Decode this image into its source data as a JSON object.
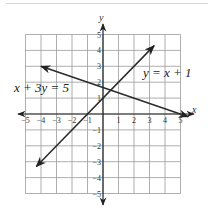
{
  "chart_data": {
    "type": "line",
    "title": "",
    "xlabel": "x",
    "ylabel": "y",
    "xlim": [
      -5,
      5
    ],
    "ylim": [
      -5,
      5
    ],
    "grid": true,
    "x_ticks": [
      "-5",
      "-4",
      "-3",
      "-2",
      "-1",
      "1",
      "2",
      "3",
      "4",
      "5"
    ],
    "y_ticks": [
      "5",
      "4",
      "3",
      "2",
      "1",
      "-1",
      "-2",
      "-3",
      "-4",
      "-5"
    ],
    "series": [
      {
        "name": "y = x + 1",
        "label_parts": [
          "y",
          " = ",
          "x",
          " + 1"
        ],
        "x": [
          -4.3,
          3.3
        ],
        "y": [
          -3.3,
          4.3
        ],
        "arrows": "both"
      },
      {
        "name": "x + 3y = 5",
        "label_parts": [
          "x",
          " + 3",
          "y",
          " = 5"
        ],
        "x": [
          -4,
          5.5
        ],
        "y": [
          3,
          -0.17
        ],
        "arrows": "both"
      }
    ],
    "annotations": [
      {
        "text": "y = x + 1",
        "near": [
          3.2,
          1.9
        ]
      },
      {
        "text": "x + 3y = 5",
        "near": [
          -5,
          1.6
        ]
      }
    ],
    "intersection": [
      0.5,
      1.5
    ]
  },
  "labels": {
    "line1": "y = x + 1",
    "line2": "x + 3y = 5",
    "x_axis": "x",
    "y_axis": "y"
  },
  "ticks": {
    "x": [
      {
        "v": -5,
        "t": "-5"
      },
      {
        "v": -4,
        "t": "-4"
      },
      {
        "v": -3,
        "t": "-3"
      },
      {
        "v": -2,
        "t": "-2"
      },
      {
        "v": -1,
        "t": "-1"
      },
      {
        "v": 1,
        "t": "1"
      },
      {
        "v": 2,
        "t": "2"
      },
      {
        "v": 3,
        "t": "3"
      },
      {
        "v": 4,
        "t": "4"
      },
      {
        "v": 5,
        "t": "5"
      }
    ],
    "y": [
      {
        "v": 5,
        "t": "5"
      },
      {
        "v": 4,
        "t": "4"
      },
      {
        "v": 3,
        "t": "3"
      },
      {
        "v": 2,
        "t": "2"
      },
      {
        "v": 1,
        "t": "1"
      },
      {
        "v": -1,
        "t": "-1"
      },
      {
        "v": -2,
        "t": "-2"
      },
      {
        "v": -3,
        "t": "-3"
      },
      {
        "v": -4,
        "t": "-4"
      },
      {
        "v": -5,
        "t": "-5"
      }
    ]
  },
  "colors": {
    "grid": "#9a9a9a",
    "axis": "#222222",
    "line": "#2a2a2a",
    "rule": "#d8d8d8"
  }
}
